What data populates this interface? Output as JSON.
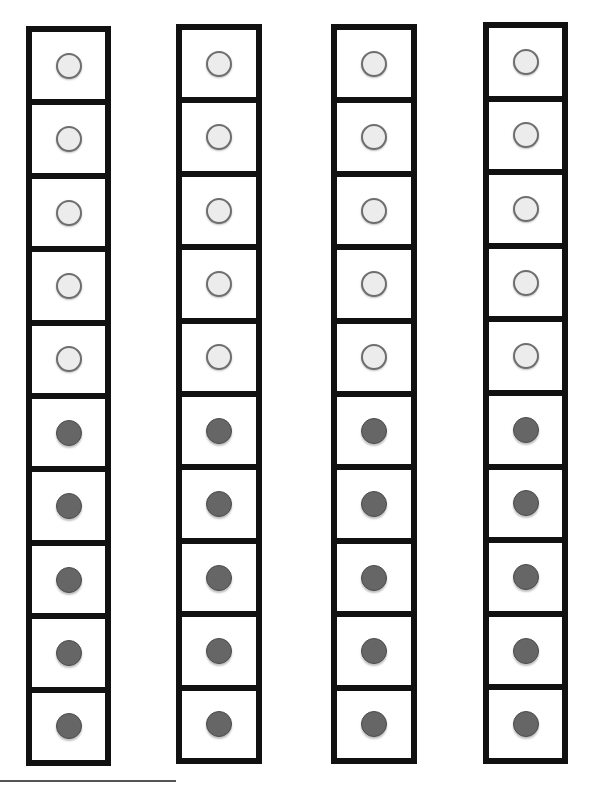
{
  "frames": [
    {
      "id": "frame-1",
      "left": 26,
      "top": 26,
      "width": 85,
      "height": 740,
      "cells": [
        "empty",
        "empty",
        "empty",
        "empty",
        "empty",
        "filled",
        "filled",
        "filled",
        "filled",
        "filled"
      ]
    },
    {
      "id": "frame-2",
      "left": 176,
      "top": 24,
      "width": 86,
      "height": 740,
      "cells": [
        "empty",
        "empty",
        "empty",
        "empty",
        "empty",
        "filled",
        "filled",
        "filled",
        "filled",
        "filled"
      ]
    },
    {
      "id": "frame-3",
      "left": 331,
      "top": 24,
      "width": 86,
      "height": 740,
      "cells": [
        "empty",
        "empty",
        "empty",
        "empty",
        "empty",
        "filled",
        "filled",
        "filled",
        "filled",
        "filled"
      ]
    },
    {
      "id": "frame-4",
      "left": 483,
      "top": 22,
      "width": 85,
      "height": 742,
      "cells": [
        "empty",
        "empty",
        "empty",
        "empty",
        "empty",
        "filled",
        "filled",
        "filled",
        "filled",
        "filled"
      ]
    }
  ],
  "summary": {
    "frames_count": 4,
    "cells_per_frame": 10,
    "empty_per_frame": 5,
    "filled_per_frame": 5
  },
  "colors": {
    "border": "#111111",
    "empty_fill": "#ececec",
    "filled_fill": "#666666"
  }
}
